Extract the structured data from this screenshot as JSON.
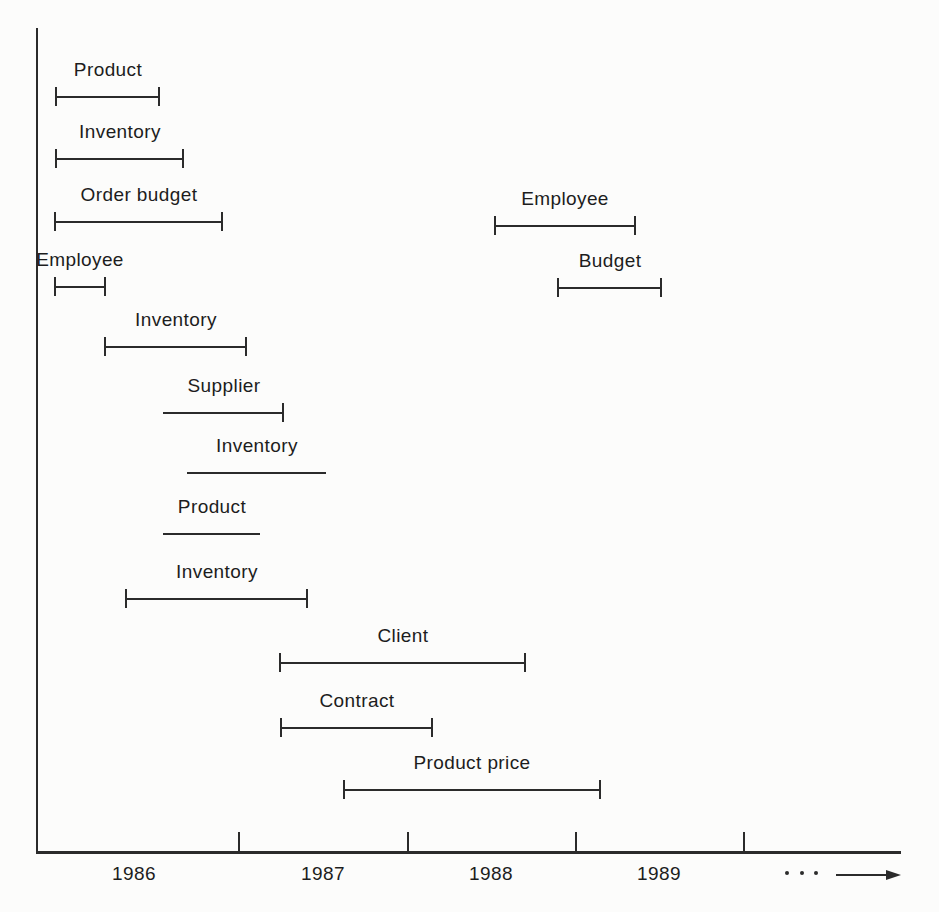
{
  "colors": {
    "ink": "#2b2b2b",
    "text": "#1d1d1d",
    "paper": "#fcfcfb"
  },
  "chart_data": {
    "type": "gantt",
    "title": "",
    "xlabel": "time (years)",
    "x_axis": {
      "year_labels": [
        {
          "text": "1986",
          "x": 134
        },
        {
          "text": "1987",
          "x": 323
        },
        {
          "text": "1988",
          "x": 491
        },
        {
          "text": "1989",
          "x": 659
        }
      ],
      "ticks_px": [
        238,
        407,
        575,
        743
      ],
      "continuation_dots": 3,
      "arrow": true
    },
    "bars": [
      {
        "label": "Product",
        "start_year": 1986.1,
        "end_year": 1986.6,
        "tick_left": true,
        "tick_right": true,
        "px": {
          "x1": 55,
          "x2": 160,
          "y": 97
        }
      },
      {
        "label": "Inventory",
        "start_year": 1986.1,
        "end_year": 1986.7,
        "tick_left": true,
        "tick_right": true,
        "px": {
          "x1": 55,
          "x2": 184,
          "y": 159
        }
      },
      {
        "label": "Order budget",
        "start_year": 1986.1,
        "end_year": 1986.9,
        "tick_left": true,
        "tick_right": true,
        "px": {
          "x1": 54,
          "x2": 223,
          "y": 222
        }
      },
      {
        "label": "Employee",
        "start_year": 1988.5,
        "end_year": 1989.4,
        "tick_left": true,
        "tick_right": true,
        "px": {
          "x1": 494,
          "x2": 636,
          "y": 226
        }
      },
      {
        "label": "Employee",
        "start_year": 1986.1,
        "end_year": 1986.3,
        "tick_left": true,
        "tick_right": true,
        "px": {
          "x1": 54,
          "x2": 106,
          "y": 287
        }
      },
      {
        "label": "Budget",
        "start_year": 1988.9,
        "end_year": 1989.5,
        "tick_left": true,
        "tick_right": true,
        "px": {
          "x1": 557,
          "x2": 662,
          "y": 288
        }
      },
      {
        "label": "Inventory",
        "start_year": 1986.3,
        "end_year": 1987.1,
        "tick_left": true,
        "tick_right": true,
        "px": {
          "x1": 104,
          "x2": 247,
          "y": 347
        }
      },
      {
        "label": "Supplier",
        "start_year": 1986.6,
        "end_year": 1987.3,
        "tick_left": false,
        "tick_right": true,
        "px": {
          "x1": 163,
          "x2": 284,
          "y": 413
        }
      },
      {
        "label": "Inventory",
        "start_year": 1986.8,
        "end_year": 1987.5,
        "tick_left": false,
        "tick_right": false,
        "px": {
          "x1": 187,
          "x2": 326,
          "y": 473
        }
      },
      {
        "label": "Product",
        "start_year": 1986.6,
        "end_year": 1987.1,
        "tick_left": false,
        "tick_right": false,
        "px": {
          "x1": 163,
          "x2": 260,
          "y": 534
        }
      },
      {
        "label": "Inventory",
        "start_year": 1986.4,
        "end_year": 1987.4,
        "tick_left": true,
        "tick_right": true,
        "px": {
          "x1": 125,
          "x2": 308,
          "y": 599
        }
      },
      {
        "label": "Client",
        "start_year": 1987.2,
        "end_year": 1988.7,
        "tick_left": true,
        "tick_right": true,
        "px": {
          "x1": 279,
          "x2": 526,
          "y": 663
        }
      },
      {
        "label": "Contract",
        "start_year": 1987.2,
        "end_year": 1988.2,
        "tick_left": true,
        "tick_right": true,
        "px": {
          "x1": 280,
          "x2": 433,
          "y": 728
        }
      },
      {
        "label": "Product price",
        "start_year": 1987.6,
        "end_year": 1989.2,
        "tick_left": true,
        "tick_right": true,
        "px": {
          "x1": 343,
          "x2": 601,
          "y": 790
        }
      }
    ],
    "layout": {
      "axis_x": 36,
      "y_axis_top": 28,
      "x_axis_y": 851,
      "x_axis_right": 901,
      "x_axis_stroke": 3,
      "stroke": 2,
      "axis_tick_h": 19,
      "bar_tick_h": 19,
      "year_label_top_offset": 13,
      "bar_label_offset": 37,
      "dots_px": [
        785,
        800,
        814
      ],
      "dots_y": 871,
      "arrow": {
        "x1": 836,
        "x2": 888,
        "y": 874
      }
    }
  }
}
